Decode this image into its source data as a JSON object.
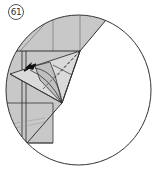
{
  "step": {
    "number": "61"
  },
  "diagram": {
    "paper_color": "#c8c8c8",
    "line_color": "#333333",
    "background": "#ffffff",
    "arrow": "push-arrow"
  }
}
